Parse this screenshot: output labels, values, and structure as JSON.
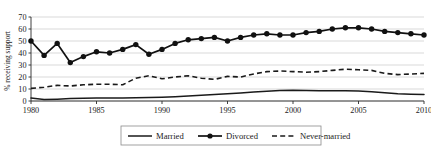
{
  "chart_data": {
    "type": "line",
    "title": "",
    "subtitle": "",
    "xlabel": "",
    "ylabel": "% receiving support",
    "xlim": [
      1980,
      2010
    ],
    "ylim": [
      0,
      70
    ],
    "grid": true,
    "grid_axis": "y",
    "legend_position": "bottom",
    "x_tick_labels": [
      "1980",
      "1985",
      "1990",
      "1995",
      "2000",
      "2005",
      "2010"
    ],
    "x_ticks": [
      1980,
      1985,
      1990,
      1995,
      2000,
      2005,
      2010
    ],
    "y_tick_labels": [
      "0",
      "10",
      "20",
      "30",
      "40",
      "50",
      "60",
      "70"
    ],
    "y_ticks": [
      0,
      10,
      20,
      30,
      40,
      50,
      60,
      70
    ],
    "x": [
      1980,
      1981,
      1982,
      1983,
      1984,
      1985,
      1986,
      1987,
      1988,
      1989,
      1990,
      1991,
      1992,
      1993,
      1994,
      1995,
      1996,
      1997,
      1998,
      1999,
      2000,
      2001,
      2002,
      2003,
      2004,
      2005,
      2006,
      2007,
      2008,
      2009,
      2010
    ],
    "series": [
      {
        "name": "Married",
        "style": "solid-thin",
        "markers": false,
        "values": [
          2.5,
          1.2,
          1.5,
          2.0,
          2.2,
          2.4,
          2.5,
          2.6,
          2.8,
          3.0,
          3.2,
          3.6,
          4.2,
          4.8,
          5.4,
          6.0,
          6.6,
          7.4,
          8.2,
          8.8,
          9.0,
          8.8,
          8.6,
          8.6,
          8.6,
          8.4,
          7.8,
          6.8,
          6.0,
          5.6,
          5.4
        ]
      },
      {
        "name": "Divorced",
        "style": "solid-thick-markers",
        "markers": true,
        "values": [
          50,
          38,
          48,
          32,
          37,
          41,
          40,
          43,
          47,
          39,
          43,
          48,
          51,
          52,
          53,
          50,
          53,
          55,
          56,
          55,
          55,
          57,
          58,
          60,
          61,
          61,
          60,
          58,
          57,
          56,
          55
        ]
      },
      {
        "name": "Never-married",
        "style": "dashed",
        "markers": false,
        "values": [
          10.5,
          11.5,
          13.0,
          12.5,
          13.5,
          14.0,
          14.0,
          13.5,
          19.0,
          21.0,
          18.5,
          20.0,
          21.0,
          19.0,
          18.0,
          20.5,
          20.0,
          22.5,
          24.5,
          25.0,
          24.5,
          24.0,
          24.5,
          25.5,
          26.5,
          26.0,
          25.5,
          23.0,
          22.0,
          22.5,
          23.0
        ]
      }
    ],
    "colors": {
      "married": "#1a1a1a",
      "divorced": "#111111",
      "never_married": "#1a1a1a",
      "gridline": "#c8c8c8",
      "axis": "#2b2b2b",
      "background": "#ffffff"
    }
  },
  "legend": {
    "items": [
      {
        "label": "Married"
      },
      {
        "label": "Divorced"
      },
      {
        "label": "Never-married"
      }
    ]
  }
}
